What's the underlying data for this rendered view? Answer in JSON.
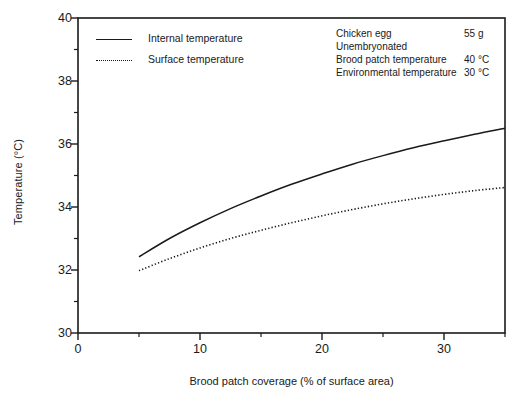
{
  "chart_data": {
    "type": "line",
    "title": "",
    "xlabel": "Brood patch coverage (% of surface area)",
    "ylabel": "Temperature (°C)",
    "xlim": [
      0,
      35
    ],
    "ylim": [
      30,
      40
    ],
    "xticks": [
      0,
      10,
      20,
      30
    ],
    "xtick_labels": [
      "0",
      "10",
      "20",
      "30"
    ],
    "xminor_ticks": [
      5,
      15,
      25,
      35
    ],
    "yticks": [
      30,
      32,
      34,
      36,
      38,
      40
    ],
    "ytick_labels": [
      "30",
      "32",
      "34",
      "36",
      "38",
      "40"
    ],
    "yminor_ticks": [
      31,
      33,
      35,
      37,
      39
    ],
    "grid": false,
    "legend_position": "top-left-inside",
    "x": [
      5,
      7.5,
      10,
      12.5,
      15,
      17.5,
      20,
      22.5,
      25,
      27.5,
      30,
      32.5,
      35
    ],
    "series": [
      {
        "name": "Internal temperature",
        "style": "solid",
        "color": "#1a1a1a",
        "values": [
          32.42,
          33.0,
          33.5,
          33.95,
          34.35,
          34.72,
          35.05,
          35.36,
          35.63,
          35.88,
          36.1,
          36.31,
          36.5
        ]
      },
      {
        "name": "Surface temperature",
        "style": "dotted",
        "color": "#1a1a1a",
        "values": [
          31.98,
          32.36,
          32.7,
          33.0,
          33.26,
          33.5,
          33.72,
          33.92,
          34.1,
          34.26,
          34.4,
          34.52,
          34.62
        ]
      }
    ],
    "annotations": [
      {
        "key": "Chicken egg",
        "value": "55 g"
      },
      {
        "key": "Unembryonated",
        "value": ""
      },
      {
        "key": "Brood patch temperature",
        "value": "40 °C"
      },
      {
        "key": "Environmental temperature",
        "value": "30 °C"
      }
    ]
  }
}
